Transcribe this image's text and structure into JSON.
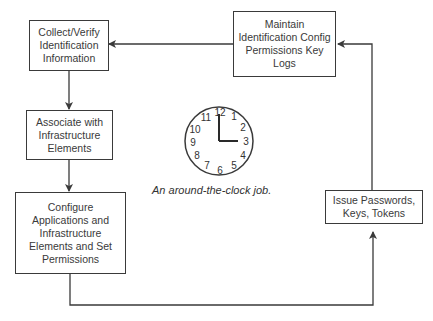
{
  "diagram": {
    "nodes": [
      {
        "id": "collect",
        "label": "Collect/Verify\nIdentification\nInformation"
      },
      {
        "id": "associate",
        "label": "Associate with\nInfrastructure\nElements"
      },
      {
        "id": "configure",
        "label": "Configure\nApplications and\nInfrastructure\nElements and Set\nPermissions"
      },
      {
        "id": "issue",
        "label": "Issue Passwords,\nKeys, Tokens"
      },
      {
        "id": "maintain",
        "label": "Maintain\nIdentification Config\nPermissions Key\nLogs"
      }
    ],
    "edges": [
      {
        "from": "collect",
        "to": "associate"
      },
      {
        "from": "associate",
        "to": "configure"
      },
      {
        "from": "configure",
        "to": "issue"
      },
      {
        "from": "issue",
        "to": "maintain"
      },
      {
        "from": "maintain",
        "to": "collect"
      }
    ],
    "clock": {
      "numbers": [
        "12",
        "1",
        "2",
        "3",
        "4",
        "5",
        "6",
        "7",
        "8",
        "9",
        "10",
        "11"
      ],
      "time": "3:00"
    },
    "caption": "An around-the-clock job."
  },
  "colors": {
    "line": "#3a3a3a",
    "text": "#333333",
    "background": "#ffffff"
  }
}
